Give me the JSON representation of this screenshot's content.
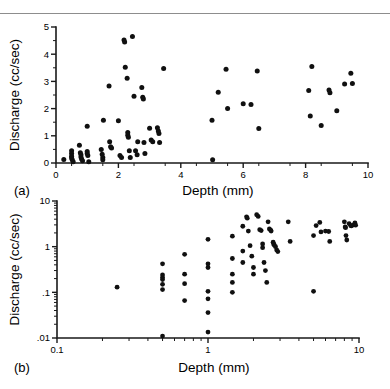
{
  "figure": {
    "background_color": "#ffffff",
    "marker_color": "#101010",
    "axis_color": "#1a1a1a",
    "rule_color": "#8d8d8d"
  },
  "panels": [
    {
      "tag": "(a)",
      "xlabel": "Depth (mm)",
      "ylabel": "Discharge (cc/sec)",
      "xticks": [
        "0",
        "2",
        "4",
        "6",
        "8",
        "10"
      ],
      "yticks": [
        "0",
        "1",
        "2",
        "3",
        "4",
        "5"
      ]
    },
    {
      "tag": "(b)",
      "xlabel": "Depth (mm)",
      "ylabel": "Discharge (cc/sec)",
      "xticks": [
        "0.1",
        "1",
        "10"
      ],
      "yticks": [
        ".01",
        ".1",
        "1",
        "10"
      ]
    }
  ],
  "chart_data": [
    {
      "type": "scatter",
      "panel": "(a)",
      "title": "",
      "xlabel": "Depth (mm)",
      "ylabel": "Discharge (cc/sec)",
      "xscale": "linear",
      "yscale": "linear",
      "xlim": [
        0,
        10
      ],
      "ylim": [
        0,
        5
      ],
      "xticks": [
        0,
        2,
        4,
        6,
        8,
        10
      ],
      "yticks": [
        0,
        1,
        2,
        3,
        4,
        5
      ],
      "xminor_step": 0.5,
      "yminor_step": 0.5,
      "grid": false,
      "legend": false,
      "series": [
        {
          "name": "Discharge vs Depth",
          "points": [
            [
              0.25,
              0.13
            ],
            [
              0.5,
              0.45
            ],
            [
              0.5,
              0.35
            ],
            [
              0.5,
              0.25
            ],
            [
              0.5,
              0.18
            ],
            [
              0.52,
              0.12
            ],
            [
              0.55,
              0.05
            ],
            [
              0.75,
              0.65
            ],
            [
              0.78,
              0.38
            ],
            [
              0.8,
              0.3
            ],
            [
              0.8,
              0.22
            ],
            [
              0.82,
              0.15
            ],
            [
              0.85,
              0.08
            ],
            [
              1.0,
              1.35
            ],
            [
              1.0,
              0.42
            ],
            [
              1.0,
              0.35
            ],
            [
              1.02,
              0.28
            ],
            [
              1.05,
              0.05
            ],
            [
              1.45,
              0.5
            ],
            [
              1.48,
              0.32
            ],
            [
              1.5,
              0.2
            ],
            [
              1.5,
              0.12
            ],
            [
              1.52,
              1.57
            ],
            [
              1.7,
              2.83
            ],
            [
              1.72,
              0.78
            ],
            [
              1.75,
              0.6
            ],
            [
              1.78,
              0.55
            ],
            [
              2.0,
              1.55
            ],
            [
              2.05,
              0.28
            ],
            [
              2.1,
              0.2
            ],
            [
              2.18,
              4.52
            ],
            [
              2.2,
              4.45
            ],
            [
              2.22,
              3.52
            ],
            [
              2.28,
              3.12
            ],
            [
              2.3,
              1.12
            ],
            [
              2.3,
              1.02
            ],
            [
              2.32,
              0.95
            ],
            [
              2.35,
              0.45
            ],
            [
              2.38,
              0.2
            ],
            [
              2.45,
              4.65
            ],
            [
              2.5,
              2.45
            ],
            [
              2.55,
              0.45
            ],
            [
              2.6,
              0.3
            ],
            [
              2.62,
              0.78
            ],
            [
              2.75,
              2.78
            ],
            [
              2.78,
              2.42
            ],
            [
              2.8,
              2.35
            ],
            [
              2.82,
              0.75
            ],
            [
              2.85,
              0.35
            ],
            [
              3.0,
              1.28
            ],
            [
              3.05,
              0.85
            ],
            [
              3.1,
              0.78
            ],
            [
              3.25,
              1.3
            ],
            [
              3.28,
              1.18
            ],
            [
              3.3,
              1.08
            ],
            [
              3.32,
              0.75
            ],
            [
              3.45,
              3.47
            ],
            [
              5.0,
              1.57
            ],
            [
              5.02,
              0.12
            ],
            [
              5.2,
              2.6
            ],
            [
              5.45,
              3.45
            ],
            [
              5.5,
              2.0
            ],
            [
              6.0,
              2.18
            ],
            [
              6.25,
              2.15
            ],
            [
              6.45,
              3.38
            ],
            [
              6.5,
              1.27
            ],
            [
              8.1,
              2.67
            ],
            [
              8.15,
              1.73
            ],
            [
              8.2,
              3.55
            ],
            [
              8.5,
              1.38
            ],
            [
              8.75,
              2.68
            ],
            [
              8.78,
              2.58
            ],
            [
              9.0,
              1.92
            ],
            [
              9.25,
              2.9
            ],
            [
              9.45,
              3.3
            ],
            [
              9.5,
              2.92
            ]
          ]
        }
      ]
    },
    {
      "type": "scatter",
      "panel": "(b)",
      "title": "",
      "xlabel": "Depth (mm)",
      "ylabel": "Discharge (cc/sec)",
      "xscale": "log",
      "yscale": "log",
      "xlim": [
        0.1,
        10
      ],
      "ylim": [
        0.01,
        10
      ],
      "xticks": [
        0.1,
        1,
        10
      ],
      "yticks": [
        0.01,
        0.1,
        1,
        10
      ],
      "grid": false,
      "legend": false,
      "series": [
        {
          "name": "Discharge vs Depth (log-log)",
          "points": [
            [
              0.25,
              0.13
            ],
            [
              0.5,
              0.42
            ],
            [
              0.5,
              0.24
            ],
            [
              0.5,
              0.21
            ],
            [
              0.5,
              0.19
            ],
            [
              0.5,
              0.15
            ],
            [
              0.5,
              0.115
            ],
            [
              0.5,
              0.011
            ],
            [
              0.7,
              0.68
            ],
            [
              0.7,
              0.25
            ],
            [
              0.7,
              0.155
            ],
            [
              0.7,
              0.066
            ],
            [
              1.0,
              1.45
            ],
            [
              1.0,
              0.42
            ],
            [
              1.0,
              0.35
            ],
            [
              1.0,
              0.105
            ],
            [
              1.0,
              0.072
            ],
            [
              1.0,
              0.036
            ],
            [
              1.0,
              0.0135
            ],
            [
              1.45,
              1.7
            ],
            [
              1.45,
              0.55
            ],
            [
              1.45,
              0.25
            ],
            [
              1.45,
              0.165
            ],
            [
              1.45,
              0.1
            ],
            [
              1.7,
              2.8
            ],
            [
              1.7,
              0.8
            ],
            [
              1.7,
              0.45
            ],
            [
              1.8,
              4.5
            ],
            [
              1.82,
              4.2
            ],
            [
              1.85,
              2.2
            ],
            [
              1.9,
              1.05
            ],
            [
              1.95,
              0.62
            ],
            [
              2.0,
              0.35
            ],
            [
              2.0,
              0.25
            ],
            [
              2.1,
              5.0
            ],
            [
              2.15,
              4.6
            ],
            [
              2.2,
              2.35
            ],
            [
              2.25,
              2.25
            ],
            [
              2.3,
              1.15
            ],
            [
              2.3,
              0.95
            ],
            [
              2.35,
              0.45
            ],
            [
              2.4,
              0.3
            ],
            [
              2.45,
              0.165
            ],
            [
              2.5,
              3.5
            ],
            [
              2.55,
              2.45
            ],
            [
              2.6,
              2.3
            ],
            [
              2.62,
              2.2
            ],
            [
              2.7,
              1.25
            ],
            [
              2.72,
              1.15
            ],
            [
              2.75,
              1.08
            ],
            [
              2.8,
              1.0
            ],
            [
              2.85,
              0.85
            ],
            [
              2.9,
              0.78
            ],
            [
              3.4,
              3.5
            ],
            [
              3.5,
              1.3
            ],
            [
              5.0,
              1.75
            ],
            [
              5.0,
              0.105
            ],
            [
              5.2,
              2.9
            ],
            [
              5.5,
              3.4
            ],
            [
              5.6,
              2.1
            ],
            [
              6.0,
              2.2
            ],
            [
              6.3,
              2.15
            ],
            [
              6.4,
              1.3
            ],
            [
              8.0,
              3.5
            ],
            [
              8.1,
              2.7
            ],
            [
              8.15,
              2.6
            ],
            [
              8.2,
              1.75
            ],
            [
              8.3,
              1.4
            ],
            [
              8.6,
              3.2
            ],
            [
              8.8,
              2.9
            ],
            [
              8.9,
              2.85
            ],
            [
              9.2,
              3.0
            ],
            [
              9.4,
              3.3
            ],
            [
              9.5,
              2.95
            ]
          ]
        }
      ]
    }
  ]
}
